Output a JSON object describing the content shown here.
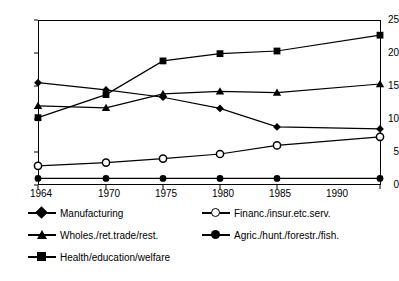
{
  "chart_data": {
    "type": "line",
    "title": "",
    "xlabel": "",
    "ylabel": "",
    "x": [
      1964,
      1970,
      1975,
      1980,
      1985,
      1990
    ],
    "categories": [
      "1964",
      "1970",
      "1975",
      "1980",
      "1985",
      "1990"
    ],
    "xlim": [
      1962.5,
      1991.5
    ],
    "ylim": [
      0,
      25
    ],
    "yticks": [
      0,
      5,
      10,
      15,
      20,
      25
    ],
    "ytick_labels": [
      "0",
      "5",
      "10",
      "15",
      "20",
      "25"
    ],
    "grid": false,
    "legend_position": "below",
    "series": [
      {
        "name": "Manufacturing",
        "marker": "diamond",
        "values": [
          15.5,
          14.4,
          13.3,
          11.6,
          8.8,
          8.5
        ]
      },
      {
        "name": "Financ./insur.etc.serv.",
        "marker": "circle-open",
        "values": [
          2.9,
          3.4,
          4.0,
          4.7,
          6.0,
          7.3
        ]
      },
      {
        "name": "Wholes./ret.trade/rest.",
        "marker": "triangle",
        "values": [
          12.0,
          11.7,
          13.8,
          14.2,
          14.0,
          15.3
        ]
      },
      {
        "name": "Agric./hunt./forestr./fish.",
        "marker": "circle-filled",
        "values": [
          1.0,
          1.0,
          1.0,
          1.0,
          1.0,
          1.0
        ]
      },
      {
        "name": "Health/education/welfare",
        "marker": "square",
        "values": [
          10.2,
          13.7,
          18.8,
          19.9,
          20.3,
          22.7
        ]
      }
    ]
  },
  "legend": {
    "rows": [
      [
        "Manufacturing",
        "Financ./insur.etc.serv."
      ],
      [
        "Wholes./ret.trade/rest.",
        "Agric./hunt./forestr./fish."
      ],
      [
        "Health/education/welfare"
      ]
    ]
  },
  "colors": {
    "line": "#000000",
    "marker_fill": "#000000",
    "marker_open_fill": "#ffffff",
    "background": "#ffffff",
    "axis": "#000000"
  }
}
